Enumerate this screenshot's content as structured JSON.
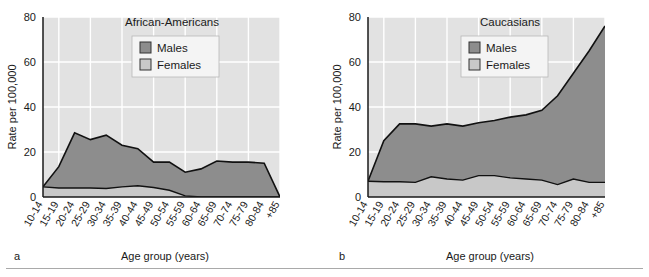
{
  "figure": {
    "panels": [
      {
        "letter": "a",
        "title": "African-Americans",
        "xlabel": "Age group (years)",
        "ylabel": "Rate per 100,000"
      },
      {
        "letter": "b",
        "title": "Caucasians",
        "xlabel": "Age group (years)",
        "ylabel": "Rate per 100,000"
      }
    ],
    "legend": {
      "males_label": "Males",
      "females_label": "Females"
    },
    "colors": {
      "males_fill": "#8d8d8d",
      "females_fill": "#c8c8c8",
      "plot_background": "#e2e2e2",
      "gridline": "#ffffff",
      "axis_line": "#1a1a1a",
      "curve_line": "#111111",
      "legend_background": "#f4f4f4",
      "page_background": "#ffffff"
    }
  },
  "chart_data": [
    {
      "type": "area",
      "title": "African-Americans",
      "panel_letter": "a",
      "xlabel": "Age group (years)",
      "ylabel": "Rate per 100,000",
      "ylim": [
        0,
        80
      ],
      "yticks": [
        0,
        20,
        40,
        60,
        80
      ],
      "grid": true,
      "legend_position": "top-center",
      "stacking": "overlaid",
      "categories": [
        "10-14",
        "15-19",
        "20-24",
        "25-29",
        "30-34",
        "35-39",
        "40-44",
        "45-49",
        "50-54",
        "55-59",
        "60-64",
        "65-69",
        "70-74",
        "75-79",
        "80-84",
        "+85"
      ],
      "series": [
        {
          "name": "Males",
          "values": [
            4.5,
            13.5,
            28.5,
            25.5,
            27.5,
            23.0,
            21.5,
            15.5,
            15.5,
            11.0,
            12.5,
            16.0,
            15.5,
            15.5,
            15.0,
            0.0
          ]
        },
        {
          "name": "Females",
          "values": [
            4.5,
            4.0,
            4.0,
            4.0,
            3.8,
            4.5,
            5.0,
            4.2,
            3.0,
            0.5,
            0.0,
            0.0,
            0.0,
            0.0,
            0.0,
            0.0
          ]
        }
      ]
    },
    {
      "type": "area",
      "title": "Caucasians",
      "panel_letter": "b",
      "xlabel": "Age group (years)",
      "ylabel": "Rate per 100,000",
      "ylim": [
        0,
        80
      ],
      "yticks": [
        0,
        20,
        40,
        60,
        80
      ],
      "grid": true,
      "legend_position": "top-center",
      "stacking": "overlaid",
      "categories": [
        "10-14",
        "15-19",
        "20-24",
        "25-29",
        "30-34",
        "35-39",
        "40-44",
        "45-49",
        "50-54",
        "55-59",
        "60-64",
        "65-69",
        "70-74",
        "75-79",
        "80-84",
        "+85"
      ],
      "series": [
        {
          "name": "Males",
          "values": [
            7.0,
            25.0,
            32.5,
            32.5,
            31.5,
            32.5,
            31.5,
            33.0,
            34.0,
            35.5,
            36.5,
            38.5,
            45.0,
            55.0,
            65.0,
            76.0
          ]
        },
        {
          "name": "Females",
          "values": [
            7.0,
            6.8,
            6.8,
            6.5,
            9.0,
            8.0,
            7.5,
            9.5,
            9.5,
            8.5,
            8.0,
            7.5,
            5.5,
            8.0,
            6.5,
            6.5
          ]
        }
      ]
    }
  ]
}
